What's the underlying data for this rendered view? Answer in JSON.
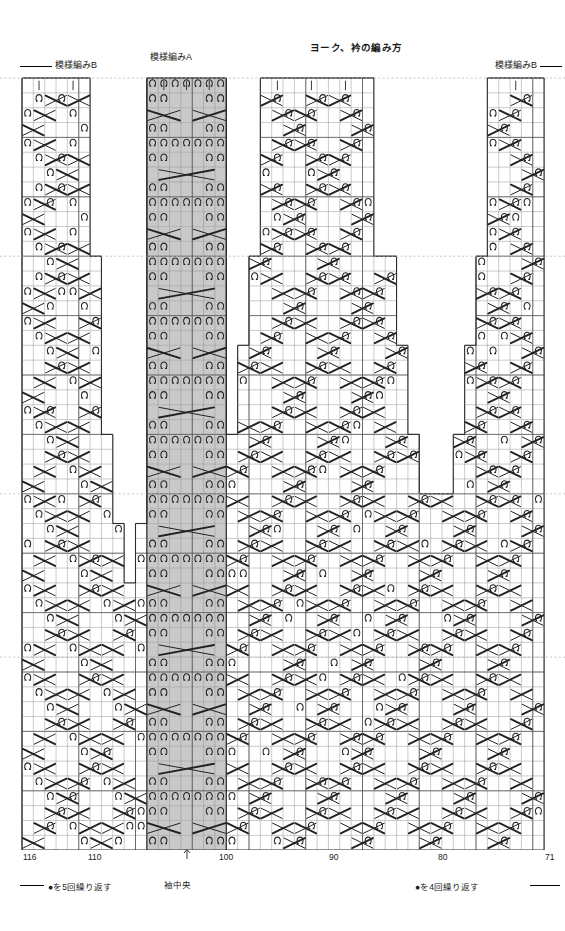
{
  "header": {
    "main_title": "ヨーク、衿の編み方",
    "pattern_b_left": "模様編みB",
    "pattern_a": "模様編みA",
    "pattern_b_right": "模様編みB"
  },
  "footer": {
    "repeat_left": "●を5回繰り返す",
    "sleeve_center": "袖中央",
    "repeat_right": "●を4回繰り返す"
  },
  "axis": {
    "labels": [
      "116",
      "110",
      "100",
      "90",
      "80",
      "71"
    ],
    "positions_px": [
      23,
      88,
      219,
      329,
      438,
      545
    ]
  },
  "symbols": {
    "twist": "Ω",
    "knit": "|",
    "cable_right": "cable-cross-right",
    "cable_left": "cable-cross-left",
    "cable_wide": "cable-cross-wide"
  },
  "colors": {
    "grid_line": "#8a8a8a",
    "grid_major": "#4a4a4a",
    "outline": "#2b2b2b",
    "pattern_a_fill": "#c9c9c9",
    "symbol": "#222222",
    "guide_dash": "#b8b8b8",
    "background": "#ffffff"
  },
  "chart_data": {
    "type": "table",
    "title": "ヨーク、衿の編み方",
    "xlabel": "",
    "ylabel": "",
    "grid": true,
    "legend_position": "none",
    "cols": 46,
    "rows": 52,
    "col_left_px": 22,
    "col_width_px": 11.35,
    "row_top_px": 78,
    "row_height_px": 14.85,
    "stitch_numbers": {
      "left": 116,
      "right": 71
    },
    "pattern_a_cols": [
      11,
      12,
      13,
      14,
      15,
      16,
      17
    ],
    "guide_rows": [
      12,
      28,
      39
    ],
    "silhouette": [
      {
        "row": 0,
        "spans": [
          [
            0,
            6
          ],
          [
            11,
            18
          ],
          [
            21,
            31
          ],
          [
            41,
            46
          ]
        ]
      },
      {
        "row": 1,
        "spans": [
          [
            0,
            6
          ],
          [
            11,
            18
          ],
          [
            21,
            31
          ],
          [
            41,
            46
          ]
        ]
      },
      {
        "row": 2,
        "spans": [
          [
            0,
            6
          ],
          [
            11,
            18
          ],
          [
            21,
            31
          ],
          [
            41,
            46
          ]
        ]
      },
      {
        "row": 3,
        "spans": [
          [
            0,
            6
          ],
          [
            11,
            18
          ],
          [
            21,
            31
          ],
          [
            41,
            46
          ]
        ]
      },
      {
        "row": 4,
        "spans": [
          [
            0,
            6
          ],
          [
            11,
            18
          ],
          [
            21,
            31
          ],
          [
            41,
            46
          ]
        ]
      },
      {
        "row": 5,
        "spans": [
          [
            0,
            6
          ],
          [
            11,
            18
          ],
          [
            21,
            31
          ],
          [
            41,
            46
          ]
        ]
      },
      {
        "row": 6,
        "spans": [
          [
            0,
            6
          ],
          [
            11,
            18
          ],
          [
            21,
            31
          ],
          [
            41,
            46
          ]
        ]
      },
      {
        "row": 7,
        "spans": [
          [
            0,
            6
          ],
          [
            11,
            18
          ],
          [
            21,
            31
          ],
          [
            41,
            46
          ]
        ]
      },
      {
        "row": 8,
        "spans": [
          [
            0,
            6
          ],
          [
            11,
            18
          ],
          [
            21,
            31
          ],
          [
            41,
            46
          ]
        ]
      },
      {
        "row": 9,
        "spans": [
          [
            0,
            6
          ],
          [
            11,
            18
          ],
          [
            21,
            31
          ],
          [
            41,
            46
          ]
        ]
      },
      {
        "row": 10,
        "spans": [
          [
            0,
            6
          ],
          [
            11,
            18
          ],
          [
            21,
            31
          ],
          [
            41,
            46
          ]
        ]
      },
      {
        "row": 11,
        "spans": [
          [
            0,
            6
          ],
          [
            11,
            18
          ],
          [
            21,
            31
          ],
          [
            41,
            46
          ]
        ]
      },
      {
        "row": 12,
        "spans": [
          [
            0,
            7
          ],
          [
            11,
            18
          ],
          [
            20,
            33
          ],
          [
            40,
            46
          ]
        ]
      },
      {
        "row": 13,
        "spans": [
          [
            0,
            7
          ],
          [
            11,
            18
          ],
          [
            20,
            33
          ],
          [
            40,
            46
          ]
        ]
      },
      {
        "row": 14,
        "spans": [
          [
            0,
            7
          ],
          [
            11,
            18
          ],
          [
            20,
            33
          ],
          [
            40,
            46
          ]
        ]
      },
      {
        "row": 15,
        "spans": [
          [
            0,
            7
          ],
          [
            11,
            18
          ],
          [
            20,
            33
          ],
          [
            40,
            46
          ]
        ]
      },
      {
        "row": 16,
        "spans": [
          [
            0,
            7
          ],
          [
            11,
            18
          ],
          [
            20,
            33
          ],
          [
            40,
            46
          ]
        ]
      },
      {
        "row": 17,
        "spans": [
          [
            0,
            7
          ],
          [
            11,
            18
          ],
          [
            20,
            33
          ],
          [
            40,
            46
          ]
        ]
      },
      {
        "row": 18,
        "spans": [
          [
            0,
            7
          ],
          [
            11,
            18
          ],
          [
            19,
            34
          ],
          [
            39,
            46
          ]
        ]
      },
      {
        "row": 19,
        "spans": [
          [
            0,
            7
          ],
          [
            11,
            18
          ],
          [
            19,
            34
          ],
          [
            39,
            46
          ]
        ]
      },
      {
        "row": 20,
        "spans": [
          [
            0,
            7
          ],
          [
            11,
            18
          ],
          [
            19,
            34
          ],
          [
            39,
            46
          ]
        ]
      },
      {
        "row": 21,
        "spans": [
          [
            0,
            7
          ],
          [
            11,
            18
          ],
          [
            19,
            34
          ],
          [
            39,
            46
          ]
        ]
      },
      {
        "row": 22,
        "spans": [
          [
            0,
            7
          ],
          [
            11,
            18
          ],
          [
            19,
            34
          ],
          [
            39,
            46
          ]
        ]
      },
      {
        "row": 23,
        "spans": [
          [
            0,
            7
          ],
          [
            11,
            18
          ],
          [
            19,
            34
          ],
          [
            39,
            46
          ]
        ]
      },
      {
        "row": 24,
        "spans": [
          [
            0,
            8
          ],
          [
            11,
            18
          ],
          [
            18,
            35
          ],
          [
            38,
            46
          ]
        ]
      },
      {
        "row": 25,
        "spans": [
          [
            0,
            8
          ],
          [
            11,
            18
          ],
          [
            18,
            35
          ],
          [
            38,
            46
          ]
        ]
      },
      {
        "row": 26,
        "spans": [
          [
            0,
            8
          ],
          [
            11,
            18
          ],
          [
            18,
            35
          ],
          [
            38,
            46
          ]
        ]
      },
      {
        "row": 27,
        "spans": [
          [
            0,
            8
          ],
          [
            11,
            18
          ],
          [
            18,
            35
          ],
          [
            38,
            46
          ]
        ]
      },
      {
        "row": 28,
        "spans": [
          [
            0,
            8
          ],
          [
            11,
            37
          ],
          [
            37,
            46
          ]
        ]
      },
      {
        "row": 29,
        "spans": [
          [
            0,
            8
          ],
          [
            11,
            37
          ],
          [
            37,
            46
          ]
        ]
      },
      {
        "row": 30,
        "spans": [
          [
            0,
            9
          ],
          [
            10,
            38
          ],
          [
            37,
            46
          ]
        ]
      },
      {
        "row": 31,
        "spans": [
          [
            0,
            9
          ],
          [
            10,
            38
          ],
          [
            37,
            46
          ]
        ]
      },
      {
        "row": 32,
        "spans": [
          [
            0,
            9
          ],
          [
            10,
            39
          ],
          [
            36,
            46
          ]
        ]
      },
      {
        "row": 33,
        "spans": [
          [
            0,
            9
          ],
          [
            10,
            39
          ],
          [
            36,
            46
          ]
        ]
      },
      {
        "row": 34,
        "spans": [
          [
            0,
            10
          ],
          [
            10,
            40
          ],
          [
            35,
            46
          ]
        ]
      },
      {
        "row": 35,
        "spans": [
          [
            0,
            10
          ],
          [
            10,
            40
          ],
          [
            35,
            46
          ]
        ]
      },
      {
        "row": 36,
        "spans": [
          [
            0,
            41
          ],
          [
            34,
            46
          ]
        ]
      },
      {
        "row": 37,
        "spans": [
          [
            0,
            41
          ],
          [
            34,
            46
          ]
        ]
      },
      {
        "row": 38,
        "spans": [
          [
            0,
            42
          ],
          [
            33,
            46
          ]
        ]
      },
      {
        "row": 39,
        "spans": [
          [
            0,
            46
          ]
        ]
      },
      {
        "row": 40,
        "spans": [
          [
            0,
            46
          ]
        ]
      },
      {
        "row": 41,
        "spans": [
          [
            0,
            46
          ]
        ]
      },
      {
        "row": 42,
        "spans": [
          [
            0,
            46
          ]
        ]
      },
      {
        "row": 43,
        "spans": [
          [
            0,
            46
          ]
        ]
      },
      {
        "row": 44,
        "spans": [
          [
            0,
            46
          ]
        ]
      },
      {
        "row": 45,
        "spans": [
          [
            0,
            46
          ]
        ]
      },
      {
        "row": 46,
        "spans": [
          [
            0,
            46
          ]
        ]
      },
      {
        "row": 47,
        "spans": [
          [
            0,
            46
          ]
        ]
      },
      {
        "row": 48,
        "spans": [
          [
            0,
            46
          ]
        ]
      },
      {
        "row": 49,
        "spans": [
          [
            0,
            46
          ]
        ]
      },
      {
        "row": 50,
        "spans": [
          [
            0,
            46
          ]
        ]
      },
      {
        "row": 51,
        "spans": [
          [
            0,
            46
          ]
        ]
      }
    ]
  }
}
